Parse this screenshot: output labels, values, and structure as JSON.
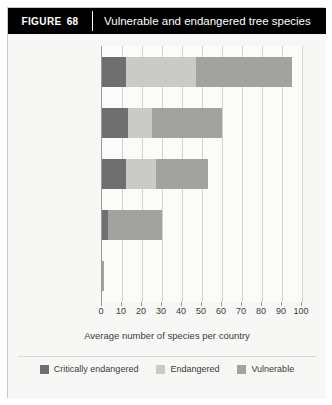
{
  "header": {
    "figure_word": "FIGURE",
    "figure_number": "68",
    "title": "Vulnerable and endangered tree species"
  },
  "legend": {
    "position": "bottom-center",
    "items": [
      {
        "label": "Critically endangered",
        "color": "#6f6f6f"
      },
      {
        "label": "Endangered",
        "color": "#cacac8"
      },
      {
        "label": "Vulnerable",
        "color": "#a2a2a0"
      }
    ]
  },
  "chart_data": {
    "type": "bar",
    "orientation": "horizontal",
    "stacked": true,
    "title": "Vulnerable and endangered tree species",
    "xlabel": "Average number of species per country",
    "ylabel": "",
    "xlim": [
      0,
      100
    ],
    "xticks": [
      0,
      10,
      20,
      30,
      40,
      50,
      60,
      70,
      80,
      90,
      100
    ],
    "xtick_labels": [
      "0",
      "10",
      "20",
      "30",
      "40",
      "50",
      "60",
      "70",
      "80",
      "90",
      "100"
    ],
    "grid": true,
    "categories": [
      "Latin America and the Caribbean",
      "Asia and the Pacific",
      "North America",
      "Africa",
      "Europe"
    ],
    "category_lines": [
      [
        "Latin America and",
        "the Caribbean"
      ],
      [
        "Asia and",
        "the Pacific"
      ],
      [
        "North America"
      ],
      [
        "Africa"
      ],
      [
        "Europe"
      ]
    ],
    "series": [
      {
        "name": "Critically endangered",
        "color": "#6f6f6f",
        "values": [
          12,
          13,
          12,
          3,
          0
        ]
      },
      {
        "name": "Endangered",
        "color": "#cacac8",
        "values": [
          35,
          12,
          15,
          0,
          0
        ]
      },
      {
        "name": "Vulnerable",
        "color": "#a2a2a0",
        "values": [
          48,
          35,
          26,
          27,
          1
        ]
      }
    ],
    "totals": [
      95,
      60,
      53,
      30,
      1
    ]
  }
}
